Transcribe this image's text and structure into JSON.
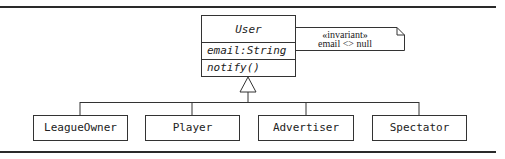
{
  "diagram": {
    "type": "UML class diagram",
    "superclass": {
      "name": "User",
      "attributes": [
        "email:String"
      ],
      "operations": [
        "notify()"
      ]
    },
    "note": {
      "stereotype": "«invariant»",
      "constraint": "email <> null"
    },
    "subclasses": [
      {
        "name": "LeagueOwner"
      },
      {
        "name": "Player"
      },
      {
        "name": "Advertiser"
      },
      {
        "name": "Spectator"
      }
    ],
    "relationship": "generalization"
  }
}
